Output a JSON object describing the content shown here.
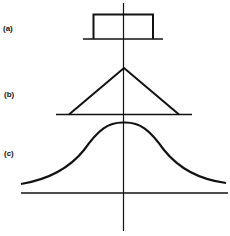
{
  "figure": {
    "panels": [
      {
        "id": "a",
        "label": "(a)",
        "shape": "rectangular-pulse"
      },
      {
        "id": "b",
        "label": "(b)",
        "shape": "triangular-pulse"
      },
      {
        "id": "c",
        "label": "(c)",
        "shape": "gaussian-bell-curve"
      }
    ],
    "colors": {
      "stroke": "#111111",
      "background": "#ffffff"
    }
  }
}
